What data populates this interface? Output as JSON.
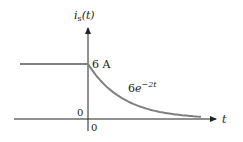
{
  "chart_data": {
    "type": "line",
    "title": "",
    "ylabel": "i_s(t)",
    "xlabel": "t",
    "y_axis_label": {
      "base": "i",
      "sub": "s",
      "arg": "(t)"
    },
    "x_axis_label": "t",
    "annotations": {
      "level_label": "6 A",
      "curve_label": {
        "coef": "6",
        "base": "e",
        "exp": "−2t"
      },
      "origin_y_tick": "0",
      "origin_x_tick": "0"
    },
    "series": [
      {
        "name": "i_s(t)",
        "segments": [
          {
            "description": "constant for t<0",
            "x": [
              -3,
              0
            ],
            "y": [
              6,
              6
            ]
          },
          {
            "description": "6e^{-2t} for t>0",
            "function": "6*exp(-2*t)",
            "x_range": [
              0,
              2.6
            ]
          }
        ],
        "color": "#808080"
      }
    ],
    "ylim": [
      0,
      6
    ],
    "grid": false,
    "legend": "none"
  }
}
